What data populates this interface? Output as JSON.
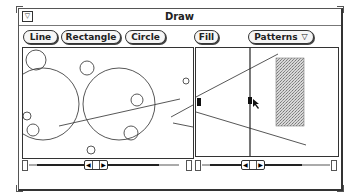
{
  "window": {
    "title": "Draw",
    "menu_mark": "▽"
  },
  "toolbar": {
    "buttons": [
      {
        "label": "Line"
      },
      {
        "label": "Rectangle"
      },
      {
        "label": "Circle"
      },
      {
        "label": "Fill"
      }
    ],
    "patterns_menu": {
      "label": "Patterns",
      "indicator": "▽"
    }
  },
  "canvas_left": {
    "shapes": {
      "circles": [
        {
          "cx": 35,
          "cy": 28,
          "r": 10
        },
        {
          "cx": 32,
          "cy": 60,
          "r": 36
        },
        {
          "cx": 86,
          "cy": 22,
          "r": 7
        },
        {
          "cx": 118,
          "cy": 60,
          "r": 36
        },
        {
          "cx": 137,
          "cy": 53,
          "r": 6
        },
        {
          "cx": 26,
          "cy": 68,
          "r": 4
        },
        {
          "cx": 32,
          "cy": 83,
          "r": 6
        },
        {
          "cx": 130,
          "cy": 86,
          "r": 7
        },
        {
          "cx": 90,
          "cy": 103,
          "r": 4
        },
        {
          "cx": 185,
          "cy": 34,
          "r": 3
        }
      ],
      "lines": [
        {
          "x1": 58,
          "y1": 79,
          "x2": 179,
          "y2": 52
        },
        {
          "x1": 170,
          "y1": 70,
          "x2": 192,
          "y2": 58
        },
        {
          "x1": 172,
          "y1": 76,
          "x2": 192,
          "y2": 80
        }
      ]
    }
  },
  "canvas_right": {
    "lines": [
      {
        "x1": 0,
        "y1": 49,
        "x2": 82,
        "y2": 5
      },
      {
        "x1": 0,
        "y1": 63,
        "x2": 110,
        "y2": 96
      }
    ],
    "stipple_rect": {
      "x": 80,
      "y": 10,
      "w": 28,
      "h": 67
    },
    "split_divider_x": 54
  },
  "scrollbars": {
    "left_arrow": "◀",
    "right_arrow": "▶"
  }
}
